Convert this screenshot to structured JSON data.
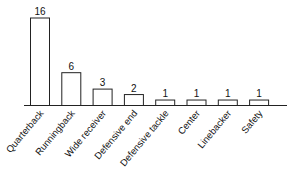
{
  "chart_data": {
    "type": "bar",
    "title": "",
    "xlabel": "",
    "ylabel": "",
    "categories": [
      "Quarterback",
      "Runningback",
      "Wide receiver",
      "Defensive end",
      "Defensive tackle",
      "Center",
      "Linebacker",
      "Safety"
    ],
    "values": [
      16,
      6,
      3,
      2,
      1,
      1,
      1,
      1
    ],
    "ylim": [
      0,
      16
    ],
    "grid": false,
    "legend": null,
    "data_labels": true,
    "bar_fill": "#ffffff",
    "bar_stroke": "#222222"
  }
}
